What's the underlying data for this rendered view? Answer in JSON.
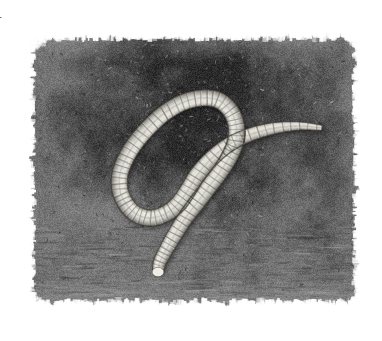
{
  "figure": {
    "label": "1",
    "caption": "",
    "kind": "micrograph",
    "modality": "light-microscopy",
    "colorspace": "grayscale",
    "background_color": "#ffffff"
  },
  "panel": {
    "x": 22,
    "y": 28,
    "width": 344,
    "height": 284,
    "edge_style": "rough-feathered",
    "background": {
      "base_color": "#6e6e6e",
      "dark_color": "#2b2b2b",
      "mid_color": "#585858",
      "light_color": "#8a8a8a",
      "texture": "granular-mottled-bacterial-lawn",
      "vignette": "dark-upper-center"
    }
  },
  "specimen": {
    "name": "nematode-worm",
    "common_name": "roundworm",
    "pose": "s-curve",
    "body_color": "#d9d7cf",
    "body_highlight": "#efece4",
    "body_shadow": "#9b978c",
    "annulation_color": "#6a675f",
    "annuli_count": 96,
    "head_end": "tapered-right",
    "tail_end": "blunt-capped-left",
    "centerline": [
      [
        322,
        128
      ],
      [
        300,
        126
      ],
      [
        276,
        128
      ],
      [
        252,
        134
      ],
      [
        230,
        144
      ],
      [
        212,
        158
      ],
      [
        198,
        174
      ],
      [
        188,
        190
      ],
      [
        178,
        204
      ],
      [
        165,
        214
      ],
      [
        150,
        218
      ],
      [
        136,
        214
      ],
      [
        126,
        204
      ],
      [
        120,
        190
      ],
      [
        120,
        174
      ],
      [
        126,
        158
      ],
      [
        136,
        142
      ],
      [
        150,
        126
      ],
      [
        166,
        112
      ],
      [
        184,
        102
      ],
      [
        202,
        98
      ],
      [
        218,
        100
      ],
      [
        230,
        110
      ],
      [
        236,
        124
      ],
      [
        236,
        140
      ],
      [
        230,
        156
      ],
      [
        220,
        172
      ],
      [
        208,
        188
      ],
      [
        196,
        204
      ],
      [
        184,
        220
      ],
      [
        174,
        236
      ],
      [
        166,
        250
      ],
      [
        160,
        262
      ],
      [
        158,
        272
      ]
    ],
    "thickness_profile": [
      4,
      7,
      10,
      12,
      13,
      14,
      15,
      15,
      15,
      15,
      15,
      15,
      15,
      15,
      15,
      15,
      15,
      15,
      15,
      15,
      15,
      15,
      15,
      15,
      15,
      15,
      15,
      15,
      15,
      14,
      14,
      13,
      12,
      10
    ]
  }
}
